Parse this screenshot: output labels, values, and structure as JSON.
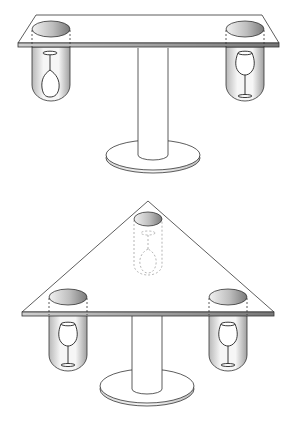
{
  "diagram": {
    "figures": [
      {
        "name": "rectangular-table",
        "tabletop_shape": "rectangle",
        "holders": [
          {
            "position": "left",
            "glass_orientation": "inverted"
          },
          {
            "position": "right",
            "glass_orientation": "upright"
          }
        ]
      },
      {
        "name": "triangular-table",
        "tabletop_shape": "triangle",
        "holders": [
          {
            "position": "back",
            "glass_orientation": "inverted",
            "hidden": true
          },
          {
            "position": "left",
            "glass_orientation": "upright"
          },
          {
            "position": "right",
            "glass_orientation": "upright"
          }
        ]
      }
    ],
    "colors": {
      "line": "#333333",
      "shade_dark": "#888888",
      "shade_light": "#f4f4f4",
      "background": "#ffffff"
    }
  }
}
